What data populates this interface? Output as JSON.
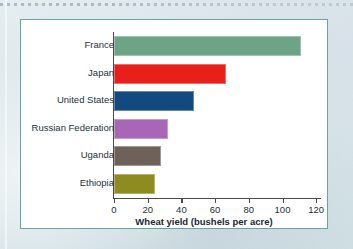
{
  "chart_data": {
    "type": "bar",
    "orientation": "horizontal",
    "title": "",
    "xlabel": "Wheat yield (bushels per acre)",
    "ylabel": "",
    "xlim": [
      0,
      120
    ],
    "xticks": [
      0,
      20,
      40,
      60,
      80,
      100,
      120
    ],
    "grid": false,
    "legend": null,
    "categories": [
      "France",
      "Japan",
      "United States",
      "Russian Federation",
      "Uganda",
      "Ethiopia"
    ],
    "values": [
      110,
      65,
      46,
      31,
      27,
      23
    ],
    "colors": [
      "#6da486",
      "#e8201c",
      "#124a80",
      "#a767b6",
      "#6e6159",
      "#8e8c20"
    ],
    "bars": [
      {
        "category": "France",
        "value": 110,
        "color": "#6da486"
      },
      {
        "category": "Japan",
        "value": 65,
        "color": "#e8201c"
      },
      {
        "category": "United States",
        "value": 46,
        "color": "#124a80"
      },
      {
        "category": "Russian Federation",
        "value": 31,
        "color": "#a767b6"
      },
      {
        "category": "Uganda",
        "value": 27,
        "color": "#6e6159"
      },
      {
        "category": "Ethiopia",
        "value": 23,
        "color": "#8e8c20"
      }
    ]
  },
  "frame": {
    "border_color": "#6aa4a8",
    "background": "#ffffff",
    "page_background": "#dbe6ea"
  }
}
